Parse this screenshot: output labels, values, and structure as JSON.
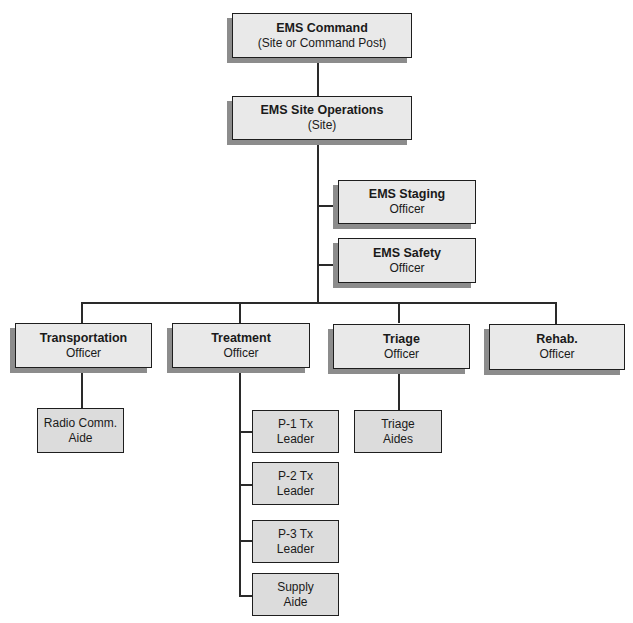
{
  "chart": {
    "command": {
      "title": "EMS Command",
      "subtitle": "(Site or Command Post)"
    },
    "site_operations": {
      "title": "EMS Site Operations",
      "subtitle": "(Site)"
    },
    "staging": {
      "title": "EMS Staging",
      "subtitle": "Officer"
    },
    "safety": {
      "title": "EMS Safety",
      "subtitle": "Officer"
    },
    "officers": [
      {
        "title": "Transportation",
        "subtitle": "Officer"
      },
      {
        "title": "Treatment",
        "subtitle": "Officer"
      },
      {
        "title": "Triage",
        "subtitle": "Officer"
      },
      {
        "title": "Rehab.",
        "subtitle": "Officer"
      }
    ],
    "transportation_aides": [
      {
        "line1": "Radio Comm.",
        "line2": "Aide"
      }
    ],
    "treatment_units": [
      {
        "line1": "P-1 Tx",
        "line2": "Leader"
      },
      {
        "line1": "P-2 Tx",
        "line2": "Leader"
      },
      {
        "line1": "P-3 Tx",
        "line2": "Leader"
      },
      {
        "line1": "Supply",
        "line2": "Aide"
      }
    ],
    "triage_units": [
      {
        "line1": "Triage",
        "line2": "Aides"
      }
    ]
  },
  "colors": {
    "box_fill": "#e9e9e9",
    "aide_fill": "#dcdcdc",
    "shadow": "#8c8c8c",
    "border": "#1e1e1e"
  }
}
